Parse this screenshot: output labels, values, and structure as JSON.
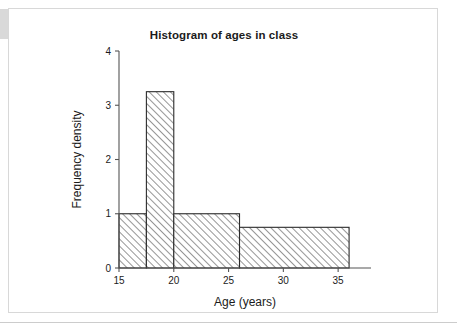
{
  "page": {
    "top_text_remnant": "",
    "left_tab_label": ""
  },
  "chart_data": {
    "type": "bar",
    "title": "Histogram of ages in class",
    "xlabel": "Age (years)",
    "ylabel": "Frequency density",
    "xlim": [
      15,
      38
    ],
    "ylim": [
      0,
      4
    ],
    "grid": false,
    "legend": false,
    "x_ticks": [
      "15",
      "20",
      "25",
      "30",
      "35"
    ],
    "x_tick_values": [
      15,
      20,
      25,
      30,
      35
    ],
    "y_ticks": [
      "0",
      "1",
      "2",
      "3",
      "4"
    ],
    "y_tick_values": [
      0,
      1,
      2,
      3,
      4
    ],
    "bins": [
      {
        "x_start": 15,
        "x_end": 17.5,
        "height": 1
      },
      {
        "x_start": 17.5,
        "x_end": 20,
        "height": 3.25
      },
      {
        "x_start": 20,
        "x_end": 26,
        "height": 1
      },
      {
        "x_start": 26,
        "x_end": 36,
        "height": 0.75
      }
    ],
    "categories": [
      "15-17.5",
      "17.5-20",
      "20-26",
      "26-36"
    ],
    "values": [
      1,
      3.25,
      1,
      0.75
    ],
    "bar_style": {
      "fill": "hatched",
      "hatch": "diagonal-45",
      "hatch_color": "#3a3a3a",
      "edge_color": "#2b2b2b",
      "face_color": "#ffffff"
    }
  }
}
